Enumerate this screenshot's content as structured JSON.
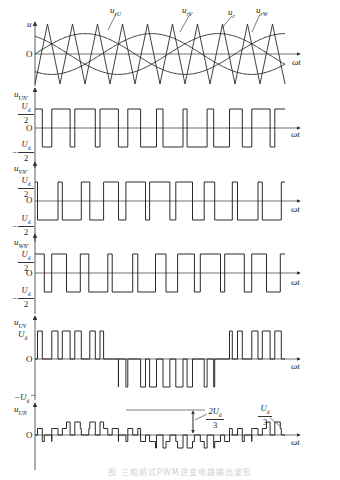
{
  "figure": {
    "caption": "图  三相桥式PWM逆变电路输出波形",
    "colors": {
      "line": "#2a2a2a",
      "axis": "#333333",
      "caption": "#cfcfcf",
      "background": "#ffffff"
    }
  },
  "panels": {
    "carrier": {
      "y_label": "u",
      "origin": "O",
      "x_label": "ωt",
      "curves": [
        "u_rU",
        "u_rV",
        "u_c",
        "u_rW"
      ],
      "labels": {
        "urU": "u",
        "urU_sub": "rU",
        "urV": "u",
        "urV_sub": "rV",
        "uc": "u",
        "uc_sub": "c",
        "urW": "u",
        "urW_sub": "rW"
      }
    },
    "uUN": {
      "y_label": "u",
      "y_sub": "UN'",
      "pos": "U",
      "pos_sub": "d",
      "den": "2",
      "neg_sign": "−",
      "origin": "O",
      "x_label": "ωt"
    },
    "uVN": {
      "y_label": "u",
      "y_sub": "VN'",
      "pos": "U",
      "pos_sub": "d",
      "den": "2",
      "neg_sign": "−",
      "origin": "O",
      "x_label": "ωt"
    },
    "uWN": {
      "y_label": "u",
      "y_sub": "WN'",
      "pos": "U",
      "pos_sub": "d",
      "den": "2",
      "neg_sign": "−",
      "origin": "O",
      "x_label": "ωt"
    },
    "uUV": {
      "y_label": "u",
      "y_sub": "UV",
      "pos": "U",
      "pos_sub": "d",
      "neg": "−U",
      "neg_sub": "d",
      "origin": "O",
      "x_label": "ωt"
    },
    "uUNn": {
      "y_label": "u",
      "y_sub": "UN",
      "origin": "O",
      "x_label": "ωt",
      "annot1_num": "2U",
      "annot1_sub": "d",
      "annot1_den": "3",
      "annot2_num": "U",
      "annot2_sub": "d",
      "annot2_den": "3"
    }
  },
  "chart_data": [
    {
      "type": "line",
      "title": "Carrier and reference waveforms",
      "ylabel": "u",
      "xlabel": "ωt",
      "series": [
        {
          "name": "u_rU",
          "shape": "sine, phase 0"
        },
        {
          "name": "u_rV",
          "shape": "sine, phase -120°"
        },
        {
          "name": "u_rW",
          "shape": "sine, phase +120°"
        },
        {
          "name": "u_c",
          "shape": "triangle carrier, ~10 periods"
        }
      ]
    },
    {
      "type": "line",
      "title": "u_UN'",
      "ylabel": "u_UN'",
      "xlabel": "ωt",
      "levels": [
        "Ud/2",
        "-Ud/2"
      ]
    },
    {
      "type": "line",
      "title": "u_VN'",
      "ylabel": "u_VN'",
      "xlabel": "ωt",
      "levels": [
        "Ud/2",
        "-Ud/2"
      ]
    },
    {
      "type": "line",
      "title": "u_WN'",
      "ylabel": "u_WN'",
      "xlabel": "ωt",
      "levels": [
        "Ud/2",
        "-Ud/2"
      ]
    },
    {
      "type": "line",
      "title": "u_UV",
      "ylabel": "u_UV",
      "xlabel": "ωt",
      "levels": [
        "Ud",
        "0",
        "-Ud"
      ]
    },
    {
      "type": "line",
      "title": "u_UN",
      "ylabel": "u_UN",
      "xlabel": "ωt",
      "levels": [
        "2Ud/3",
        "Ud/3",
        "0",
        "-Ud/3",
        "-2Ud/3"
      ],
      "annotations": [
        "2Ud/3",
        "Ud/3"
      ]
    }
  ]
}
